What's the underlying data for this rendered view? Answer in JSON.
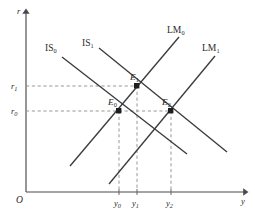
{
  "figure": {
    "kind": "is-lm-diagram",
    "background_color": "#ffffff",
    "line_color": "#3b3b3b",
    "dash_color": "#8d8d8d",
    "axis_color": "#4a4a4a",
    "point_color": "#1d1d1d"
  },
  "axes": {
    "origin_label": "O",
    "y_axis_label": "r",
    "x_axis_label": "y",
    "y_axis_name": "interest-rate-axis",
    "x_axis_name": "output-axis"
  },
  "y_ticks": [
    {
      "base": "r",
      "sub": "1",
      "value_px_y": 86
    },
    {
      "base": "r",
      "sub": "0",
      "value_px_y": 111
    }
  ],
  "x_ticks": [
    {
      "base": "y",
      "sub": "0",
      "value_px_x": 119
    },
    {
      "base": "y",
      "sub": "1",
      "value_px_x": 137
    },
    {
      "base": "y",
      "sub": "2",
      "value_px_x": 171
    }
  ],
  "curves": [
    {
      "id": "IS0",
      "base": "IS",
      "sub": "0",
      "kind": "is",
      "slope": "negative",
      "x1": 62,
      "y1": 57,
      "x2": 187,
      "y2": 154,
      "label_x": 45,
      "label_y": 51
    },
    {
      "id": "IS1",
      "base": "IS",
      "sub": "1",
      "kind": "is",
      "slope": "negative",
      "x1": 99,
      "y1": 48,
      "x2": 227,
      "y2": 152,
      "label_x": 82,
      "label_y": 46
    },
    {
      "id": "LM0",
      "base": "LM",
      "sub": "0",
      "kind": "lm",
      "slope": "positive",
      "x1": 70,
      "y1": 166,
      "x2": 179,
      "y2": 37,
      "label_x": 169,
      "label_y": 33
    },
    {
      "id": "LM1",
      "base": "LM",
      "sub": "1",
      "kind": "lm",
      "slope": "positive",
      "x1": 109,
      "y1": 184,
      "x2": 215,
      "y2": 56,
      "label_x": 204,
      "label_y": 51
    }
  ],
  "equilibria": [
    {
      "id": "E0",
      "base": "E",
      "sub": "0",
      "x": 119,
      "y": 111,
      "label_x": 110,
      "label_y": 104,
      "intersection_of": "IS0 x LM0"
    },
    {
      "id": "E1",
      "base": "E",
      "sub": "1",
      "x": 137,
      "y": 86,
      "label_x": 131,
      "label_y": 79,
      "intersection_of": "IS1 x LM0"
    },
    {
      "id": "E2",
      "base": "E",
      "sub": "2",
      "x": 171,
      "y": 111,
      "label_x": 163,
      "label_y": 104,
      "intersection_of": "IS1 x LM1"
    }
  ],
  "guides": [
    {
      "name": "r1-horizontal-guide",
      "x1": 26,
      "y1": 86,
      "x2": 137,
      "y2": 86
    },
    {
      "name": "r0-horizontal-guide",
      "x1": 26,
      "y1": 111,
      "x2": 171,
      "y2": 111
    },
    {
      "name": "y0-vertical-guide",
      "x1": 119,
      "y1": 111,
      "x2": 119,
      "y2": 192
    },
    {
      "name": "y1-vertical-guide",
      "x1": 137,
      "y1": 86,
      "x2": 137,
      "y2": 192
    },
    {
      "name": "y2-vertical-guide",
      "x1": 171,
      "y1": 111,
      "x2": 171,
      "y2": 192
    }
  ]
}
